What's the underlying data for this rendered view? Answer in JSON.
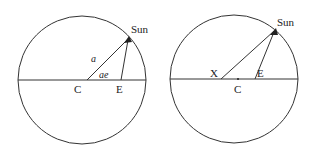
{
  "diagrams": [
    {
      "id": "left",
      "circle": {
        "cx": 82,
        "cy": 80,
        "r": 64
      },
      "diameter": {
        "x1": 18,
        "x2": 146,
        "y": 80
      },
      "sun": {
        "x": 129,
        "y": 38,
        "label": "Sun",
        "label_x": 131,
        "label_y": 33
      },
      "points": {
        "C": {
          "x": 87,
          "y": 80,
          "label": "C",
          "label_x": 74,
          "label_y": 93
        },
        "E": {
          "x": 121,
          "y": 80,
          "label": "E",
          "label_x": 116,
          "label_y": 93
        }
      },
      "segment_labels": {
        "a": {
          "text": "a",
          "x": 91,
          "y": 62
        },
        "ae": {
          "text": "ae",
          "x": 99,
          "y": 78
        }
      }
    },
    {
      "id": "right",
      "circle": {
        "cx": 234,
        "cy": 79,
        "r": 64
      },
      "diameter": {
        "x1": 170,
        "x2": 298,
        "y": 79
      },
      "sun": {
        "x": 275,
        "y": 30,
        "label": "Sun",
        "label_x": 277,
        "label_y": 26
      },
      "points": {
        "X": {
          "x": 221,
          "y": 79,
          "label": "X",
          "label_x": 210,
          "label_y": 77
        },
        "C": {
          "x": 238,
          "y": 80,
          "label": "C",
          "label_x": 234,
          "label_y": 93
        },
        "E": {
          "x": 255,
          "y": 79,
          "label": "E",
          "label_x": 257,
          "label_y": 77
        }
      }
    }
  ],
  "colors": {
    "stroke": "#333333",
    "text": "#222222",
    "background": "#ffffff"
  }
}
